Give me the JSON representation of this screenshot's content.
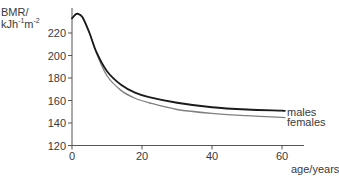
{
  "chart_data": {
    "type": "line",
    "title": "",
    "xlabel": "age/years",
    "ylabel": "BMR/ kJh⁻¹m⁻²",
    "ylabel_line1": "BMR/",
    "ylabel_line2_base": "kJh",
    "ylabel_line2_exp1": "-1",
    "ylabel_line2_mid": "m",
    "ylabel_line2_exp2": "-2",
    "xlim": [
      0,
      65
    ],
    "ylim": [
      120,
      240
    ],
    "xticks": [
      0,
      20,
      40,
      60
    ],
    "yticks": [
      120,
      140,
      160,
      180,
      200,
      220
    ],
    "xtick_labels": [
      "0",
      "20",
      "40",
      "60"
    ],
    "ytick_labels": [
      "120",
      "140",
      "160",
      "180",
      "200",
      "220"
    ],
    "grid": false,
    "legend_position": "inline-right",
    "series": [
      {
        "name": "males",
        "color": "#1a1a1a",
        "x": [
          0,
          1,
          1.7,
          3,
          5,
          7,
          10,
          14,
          18,
          22,
          30,
          40,
          50,
          60
        ],
        "y": [
          233,
          236.5,
          237,
          234,
          220,
          203,
          186,
          174,
          167,
          163,
          158,
          154,
          152,
          151
        ]
      },
      {
        "name": "females",
        "color": "#808080",
        "x": [
          0,
          1,
          1.7,
          3,
          5,
          7,
          10,
          14,
          18,
          22,
          30,
          40,
          50,
          60
        ],
        "y": [
          233,
          236.5,
          237,
          234,
          220,
          202,
          182,
          169,
          162,
          158,
          152,
          148.5,
          146.5,
          145
        ]
      }
    ]
  }
}
